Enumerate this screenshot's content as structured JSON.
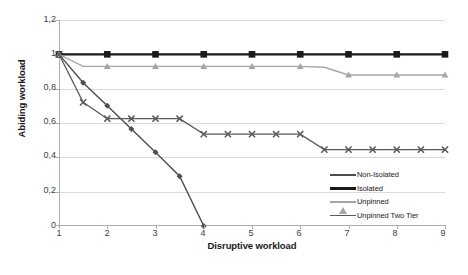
{
  "chart_data": {
    "type": "line",
    "title": "",
    "xlabel": "Disruptive workload",
    "ylabel": "Abiding workload",
    "xlim": [
      1,
      9
    ],
    "ylim": [
      0,
      1.2
    ],
    "grid": true,
    "legend_position": "bottom-right",
    "xticks": [
      "1",
      "2",
      "3",
      "4",
      "5",
      "6",
      "7",
      "8",
      "9"
    ],
    "yticks": [
      "0",
      "0,2",
      "0,4",
      "0,6",
      "0,8",
      "1",
      "1,2"
    ],
    "decimal_separator": ",",
    "series": [
      {
        "name": "Non-Isolated",
        "marker": "diamond",
        "color": "#4d4d4d",
        "x": [
          1,
          1.5,
          2,
          2.5,
          3,
          3.5,
          4
        ],
        "y": [
          1.0,
          0.835,
          0.7,
          0.565,
          0.43,
          0.29,
          0.0
        ]
      },
      {
        "name": "Isolated",
        "marker": "square",
        "color": "#1a1a1a",
        "x": [
          1,
          1.5,
          2,
          2.5,
          3,
          3.5,
          4,
          4.5,
          5,
          5.5,
          6,
          6.5,
          7,
          7.5,
          8,
          8.5,
          9
        ],
        "y": [
          1.0,
          1.0,
          1.0,
          1.0,
          1.0,
          1.0,
          1.0,
          1.0,
          1.0,
          1.0,
          1.0,
          1.0,
          1.0,
          1.0,
          1.0,
          1.0,
          1.0
        ]
      },
      {
        "name": "Unpinned",
        "marker": "triangle",
        "color": "#a6a6a6",
        "x": [
          1,
          1.5,
          2,
          2.5,
          3,
          3.5,
          4,
          4.5,
          5,
          5.5,
          6,
          6.5,
          7,
          7.5,
          8,
          8.5,
          9
        ],
        "y": [
          1.0,
          0.93,
          0.93,
          0.93,
          0.93,
          0.93,
          0.93,
          0.93,
          0.93,
          0.93,
          0.93,
          0.925,
          0.88,
          0.88,
          0.88,
          0.88,
          0.88
        ]
      },
      {
        "name": "Unpinned Two Tier",
        "marker": "x",
        "color": "#595959",
        "x": [
          1,
          1.5,
          2,
          2.5,
          3,
          3.5,
          4,
          4.5,
          5,
          5.5,
          6,
          6.5,
          7,
          7.5,
          8,
          8.5,
          9
        ],
        "y": [
          1.0,
          0.72,
          0.625,
          0.625,
          0.625,
          0.625,
          0.535,
          0.535,
          0.535,
          0.535,
          0.535,
          0.445,
          0.445,
          0.445,
          0.445,
          0.445,
          0.445
        ]
      }
    ]
  },
  "legend": {
    "items": [
      {
        "label": "Non-Isolated"
      },
      {
        "label": "Isolated"
      },
      {
        "label": "Unpinned"
      },
      {
        "label": "Unpinned Two Tier"
      }
    ]
  }
}
